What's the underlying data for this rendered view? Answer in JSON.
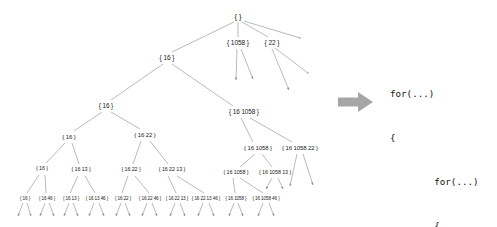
{
  "figure": {
    "edge_color": "#8c8c8c",
    "node_text_color": "#1a1a1a",
    "arrow_color": "#a6a6a6",
    "background": "#ffffff"
  },
  "tree": {
    "root_label": "{ }",
    "nodes": [
      {
        "id": "n0",
        "label": "{ }",
        "x": 238,
        "y": 17,
        "level": 0
      },
      {
        "id": "n1",
        "label": "{ 16 }",
        "x": 167,
        "y": 58,
        "level": 1
      },
      {
        "id": "n2",
        "label": "{ 1058 }",
        "x": 238,
        "y": 43,
        "level": 1
      },
      {
        "id": "n3",
        "label": "{ 22 }",
        "x": 272,
        "y": 43,
        "level": 1
      },
      {
        "id": "n4",
        "label": "{ 16 }",
        "x": 106,
        "y": 106,
        "level": 2
      },
      {
        "id": "n5",
        "label": "{ 16 1058 }",
        "x": 244,
        "y": 112,
        "level": 2
      },
      {
        "id": "n6",
        "label": "{ 16 }",
        "x": 69,
        "y": 137,
        "level": 3
      },
      {
        "id": "n7",
        "label": "{ 16 22 }",
        "x": 145,
        "y": 135,
        "level": 3
      },
      {
        "id": "n8",
        "label": "{ 16 1058 }",
        "x": 258,
        "y": 148,
        "level": 3
      },
      {
        "id": "n9",
        "label": "{ 16 1058 22 }",
        "x": 300,
        "y": 148,
        "level": 3
      },
      {
        "id": "n10",
        "label": "{ 16 }",
        "x": 42,
        "y": 169,
        "level": 4
      },
      {
        "id": "n11",
        "label": "{ 16 13 }",
        "x": 81,
        "y": 170,
        "level": 4
      },
      {
        "id": "n12",
        "label": "{ 16 22 }",
        "x": 131,
        "y": 170,
        "level": 4
      },
      {
        "id": "n13",
        "label": "{ 16 22 13 }",
        "x": 172,
        "y": 170,
        "level": 4
      },
      {
        "id": "n14",
        "label": "{ 16 1058 }",
        "x": 236,
        "y": 173,
        "level": 4
      },
      {
        "id": "n15",
        "label": "{ 16 1058 13 }",
        "x": 275,
        "y": 173,
        "level": 4
      },
      {
        "id": "n16",
        "label": "{ 16 }",
        "x": 25,
        "y": 199,
        "level": 5
      },
      {
        "id": "n17",
        "label": "{ 16 46 }",
        "x": 47,
        "y": 199,
        "level": 5
      },
      {
        "id": "n18",
        "label": "{ 16 13 }",
        "x": 71,
        "y": 199,
        "level": 5
      },
      {
        "id": "n19",
        "label": "{ 16 13 46 }",
        "x": 97,
        "y": 199,
        "level": 5
      },
      {
        "id": "n20",
        "label": "{ 16 22 }",
        "x": 123,
        "y": 199,
        "level": 5
      },
      {
        "id": "n21",
        "label": "{ 16 22 46 }",
        "x": 150,
        "y": 199,
        "level": 5
      },
      {
        "id": "n22",
        "label": "{ 16 22 13 }",
        "x": 177,
        "y": 199,
        "level": 5
      },
      {
        "id": "n23",
        "label": "{ 16 22 13 46 }",
        "x": 206,
        "y": 199,
        "level": 5
      },
      {
        "id": "n24",
        "label": "{ 16 1058 }",
        "x": 236,
        "y": 199,
        "level": 5
      },
      {
        "id": "n25",
        "label": "{ 16 1058 46 }",
        "x": 266,
        "y": 199,
        "level": 5
      }
    ]
  },
  "code": {
    "lines": [
      "for(...)",
      "{",
      "        for(...)",
      "        {",
      "                ...",
      "        }",
      "}"
    ]
  },
  "arrow": {
    "name": "transform-arrow",
    "direction": "right"
  }
}
